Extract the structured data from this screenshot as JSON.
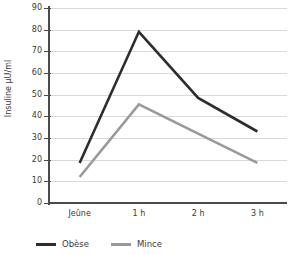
{
  "chart_data": {
    "type": "line",
    "title": "",
    "xlabel": "",
    "ylabel": "Insuline µU/ml",
    "categories": [
      "Jeûne",
      "1 h",
      "2 h",
      "3 h"
    ],
    "ylim": [
      0,
      90
    ],
    "ytick_labels": [
      "90",
      "80",
      "70",
      "60",
      "50",
      "40",
      "30",
      "20",
      "10",
      "0"
    ],
    "ytick_values": [
      90,
      80,
      70,
      60,
      50,
      40,
      30,
      20,
      10,
      0
    ],
    "grid": true,
    "legend_position": "bottom-left",
    "series": [
      {
        "name": "Obèse",
        "color": "#2d2d2d",
        "values": [
          18.5,
          79,
          48.5,
          33
        ]
      },
      {
        "name": "Mince",
        "color": "#9a9a9a",
        "values": [
          12,
          45.5,
          32,
          18.5
        ]
      }
    ]
  }
}
